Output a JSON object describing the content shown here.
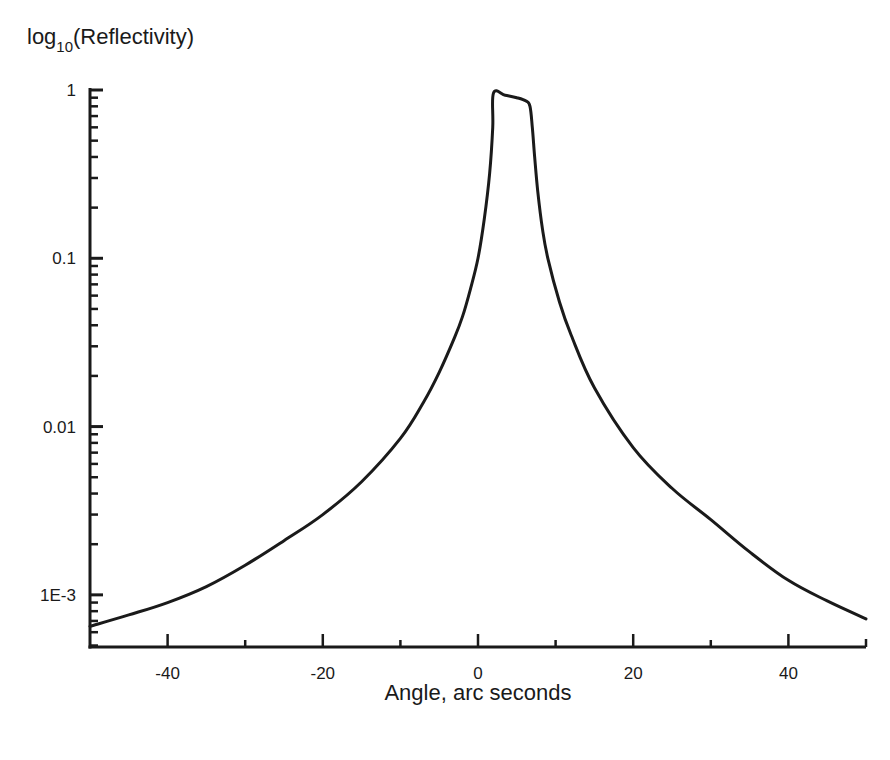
{
  "chart_data": {
    "type": "line",
    "title": "",
    "ylabel": {
      "prefix": "log",
      "subscript": "10",
      "suffix": "(Reflectivity)"
    },
    "xlabel": "Angle, arc seconds",
    "xscale": "linear",
    "yscale": "log",
    "xlim": [
      -50,
      50
    ],
    "ylim": [
      0.00049,
      1
    ],
    "grid": false,
    "legend": "none",
    "x_ticks": [
      {
        "value": -40,
        "label": "-40"
      },
      {
        "value": -20,
        "label": "-20"
      },
      {
        "value": 0,
        "label": "0"
      },
      {
        "value": 20,
        "label": "20"
      },
      {
        "value": 40,
        "label": "40"
      }
    ],
    "x_minor_ticks": [
      -30,
      -10,
      10,
      30
    ],
    "y_ticks": [
      {
        "value": 1,
        "label": "1"
      },
      {
        "value": 0.1,
        "label": "0.1"
      },
      {
        "value": 0.01,
        "label": "0.01"
      },
      {
        "value": 0.001,
        "label": "1E-3"
      }
    ],
    "series": [
      {
        "name": "Reflectivity",
        "color": "#1a1a1a",
        "x": [
          -50,
          -45,
          -40,
          -35,
          -30,
          -25,
          -20,
          -15,
          -10,
          -7,
          -5,
          -3,
          -2,
          -1,
          0,
          0.8,
          1.5,
          1.9,
          2.0,
          3.5,
          5.0,
          6.2,
          6.7,
          7.0,
          7.3,
          7.7,
          8.3,
          9.0,
          10.5,
          12,
          15,
          20,
          25,
          30,
          35,
          40,
          45,
          50
        ],
        "values": [
          0.00065,
          0.00076,
          0.0009,
          0.00112,
          0.0015,
          0.0021,
          0.003,
          0.0047,
          0.0085,
          0.014,
          0.021,
          0.034,
          0.045,
          0.065,
          0.1,
          0.17,
          0.32,
          0.6,
          0.96,
          0.93,
          0.9,
          0.86,
          0.8,
          0.6,
          0.4,
          0.25,
          0.15,
          0.1,
          0.055,
          0.035,
          0.017,
          0.0075,
          0.0043,
          0.0028,
          0.0018,
          0.00122,
          0.00092,
          0.00072
        ]
      }
    ]
  }
}
